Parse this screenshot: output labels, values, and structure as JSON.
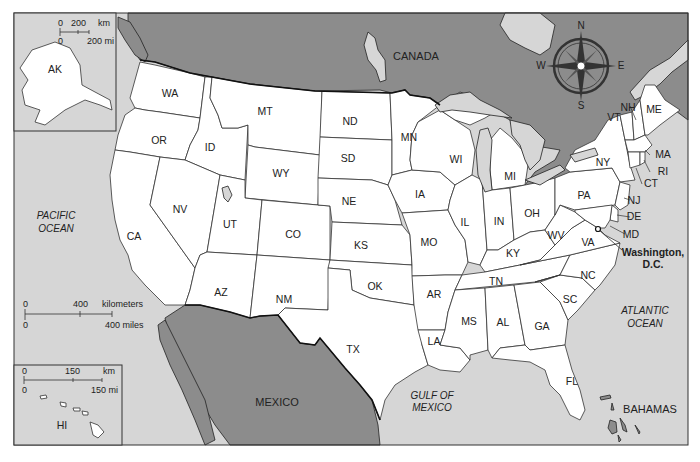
{
  "map": {
    "title": "United States Political Map",
    "colors": {
      "water": "#d6d6d6",
      "foreign_land": "#8c8c8c",
      "us_land": "#ffffff",
      "border": "#333333"
    },
    "countries": {
      "canada": "CANADA",
      "mexico": "MEXICO",
      "bahamas": "BAHAMAS"
    },
    "water_bodies": {
      "pacific": [
        "PACIFIC",
        "OCEAN"
      ],
      "atlantic": [
        "ATLANTIC",
        "OCEAN"
      ],
      "gulf": [
        "GULF OF",
        "MEXICO"
      ]
    },
    "capital": {
      "name_line1": "Washington,",
      "name_line2": "D.C."
    },
    "compass": {
      "n": "N",
      "s": "S",
      "e": "E",
      "w": "W"
    },
    "states": {
      "WA": "WA",
      "OR": "OR",
      "CA": "CA",
      "ID": "ID",
      "NV": "NV",
      "MT": "MT",
      "WY": "WY",
      "UT": "UT",
      "AZ": "AZ",
      "CO": "CO",
      "NM": "NM",
      "ND": "ND",
      "SD": "SD",
      "NE": "NE",
      "KS": "KS",
      "OK": "OK",
      "TX": "TX",
      "MN": "MN",
      "IA": "IA",
      "MO": "MO",
      "AR": "AR",
      "LA": "LA",
      "WI": "WI",
      "IL": "IL",
      "MI": "MI",
      "IN": "IN",
      "OH": "OH",
      "KY": "KY",
      "TN": "TN",
      "MS": "MS",
      "AL": "AL",
      "GA": "GA",
      "FL": "FL",
      "SC": "SC",
      "NC": "NC",
      "VA": "VA",
      "WV": "WV",
      "PA": "PA",
      "NY": "NY",
      "VT": "VT",
      "NH": "NH",
      "ME": "ME",
      "MA": "MA",
      "RI": "RI",
      "CT": "CT",
      "NJ": "NJ",
      "DE": "DE",
      "MD": "MD",
      "AK": "AK",
      "HI": "HI"
    },
    "main_scale": {
      "km_zero": "0",
      "km_value": "400",
      "km_unit": "kilometers",
      "mi_zero": "0",
      "mi_value": "400 miles"
    },
    "alaska_scale": {
      "km_zero": "0",
      "km_value": "200",
      "km_unit": "km",
      "mi_zero": "0",
      "mi_value": "200 mi"
    },
    "hawaii_scale": {
      "km_zero": "0",
      "km_value": "150",
      "km_unit": "km",
      "mi_zero": "0",
      "mi_value": "150 mi"
    }
  }
}
